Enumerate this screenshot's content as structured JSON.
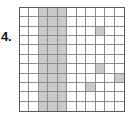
{
  "figure": {
    "item_number": "4.",
    "caption": ""
  },
  "grid": {
    "columns": 11,
    "rows": 11,
    "line_color": "#8c8c8c",
    "border_color": "#5a5a5a",
    "shade_color": "#c9c9c9",
    "background_color": "#ffffff",
    "shaded_cells": [
      [
        0,
        2
      ],
      [
        0,
        3
      ],
      [
        0,
        4
      ],
      [
        1,
        2
      ],
      [
        1,
        3
      ],
      [
        1,
        4
      ],
      [
        2,
        2
      ],
      [
        2,
        3
      ],
      [
        2,
        4
      ],
      [
        2,
        8
      ],
      [
        3,
        2
      ],
      [
        3,
        3
      ],
      [
        3,
        4
      ],
      [
        4,
        2
      ],
      [
        4,
        3
      ],
      [
        4,
        4
      ],
      [
        5,
        2
      ],
      [
        5,
        3
      ],
      [
        5,
        4
      ],
      [
        6,
        2
      ],
      [
        6,
        3
      ],
      [
        6,
        4
      ],
      [
        6,
        8
      ],
      [
        7,
        2
      ],
      [
        7,
        3
      ],
      [
        7,
        4
      ],
      [
        7,
        10
      ],
      [
        8,
        2
      ],
      [
        8,
        3
      ],
      [
        8,
        4
      ],
      [
        8,
        7
      ],
      [
        9,
        2
      ],
      [
        9,
        3
      ],
      [
        9,
        4
      ],
      [
        10,
        2
      ],
      [
        10,
        3
      ],
      [
        10,
        4
      ]
    ],
    "shaded_count": 37,
    "total_cells": 121
  }
}
